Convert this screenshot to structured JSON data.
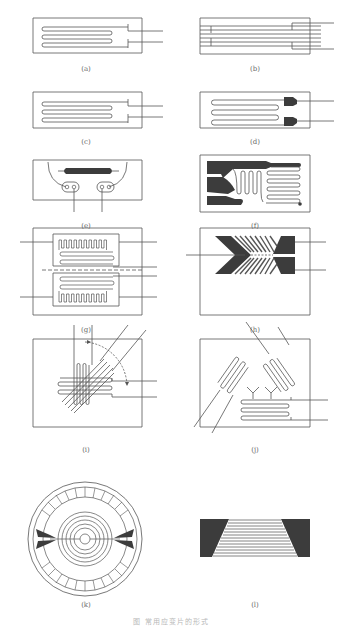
{
  "figure": {
    "caption": "图    常用应变片的形式",
    "colors": {
      "line": "#555555",
      "fill_dark": "#3c3c3c",
      "fill_mid": "#5a5a5a",
      "background": "#ffffff"
    },
    "panels": [
      {
        "id": "a",
        "label": "(a)",
        "description": "wire serpentine gauge, 3 loops, two leads right"
      },
      {
        "id": "b",
        "label": "(b)",
        "description": "short-bridge wire gauge with transverse connectors"
      },
      {
        "id": "c",
        "label": "(c)",
        "description": "wire serpentine gauge, 3 loops"
      },
      {
        "id": "d",
        "label": "(d)",
        "description": "foil serpentine gauge with solid tabs"
      },
      {
        "id": "e",
        "label": "(e)",
        "description": "semiconductor bar gauge with two round pads"
      },
      {
        "id": "f",
        "label": "(f)",
        "description": "foil gauge with dark tab pads and grids"
      },
      {
        "id": "g",
        "label": "(g)",
        "description": "dual-grid gauge with dashed centerline"
      },
      {
        "id": "h",
        "label": "(h)",
        "description": "chevron (herringbone) shear gauge"
      },
      {
        "id": "i",
        "label": "(i)",
        "description": "stacked 3-element rosette with angle arcs"
      },
      {
        "id": "j",
        "label": "(j)",
        "description": "planar delta rosette, 3 grids"
      },
      {
        "id": "k",
        "label": "(k)",
        "description": "circular diaphragm gauge with spiral and radial grids"
      },
      {
        "id": "l",
        "label": "(l)",
        "description": "trapezoidal foil gauge with dark end tabs"
      }
    ]
  }
}
